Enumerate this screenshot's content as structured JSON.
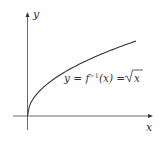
{
  "diagram": {
    "x_axis_label": "x",
    "y_axis_label": "y",
    "curve_label_lhs": "y = f",
    "curve_label_sup": "−1",
    "curve_label_mid": "(x) = ",
    "curve_label_rad": "x",
    "curve": "sqrt",
    "colors": {
      "axis": "#333333",
      "curve": "#333333"
    }
  }
}
